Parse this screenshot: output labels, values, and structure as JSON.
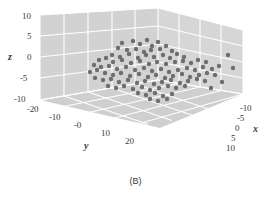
{
  "caption": "(B)",
  "colors": {
    "panel": "#d2d2d2",
    "panel_floor": "#cfcfcf",
    "panel_left": "#d6d6d6",
    "grid": "#ffffff",
    "point": "#6e6e6e",
    "text": "#3a3a3a",
    "background": "#ffffff"
  },
  "axes": {
    "x": {
      "label": "x",
      "ticks": [
        "-10",
        "-5",
        "0",
        "5",
        "10"
      ],
      "tick_values": [
        -10,
        -5,
        0,
        5,
        10
      ],
      "range": [
        -12,
        12
      ]
    },
    "y": {
      "label": "y",
      "ticks": [
        "-20",
        "-10",
        "-0",
        "10",
        "20"
      ],
      "tick_values": [
        -20,
        -10,
        0,
        10,
        20
      ],
      "range": [
        -26,
        26
      ]
    },
    "z": {
      "label": "z",
      "ticks": [
        "10",
        "5",
        "0",
        "-5",
        "-10"
      ],
      "tick_values": [
        10,
        5,
        0,
        -5,
        -10
      ],
      "range": [
        -12,
        12
      ]
    }
  },
  "chart_data": {
    "type": "scatter",
    "title": "",
    "subtitle": "",
    "caption": "(B)",
    "projection": "3d",
    "xlabel": "x",
    "ylabel": "y",
    "zlabel": "z",
    "xlim": [
      -12,
      12
    ],
    "ylim": [
      -26,
      26
    ],
    "zlim": [
      -12,
      12
    ],
    "xticks": [
      -10,
      -5,
      0,
      5,
      10
    ],
    "yticks": [
      -20,
      -10,
      0,
      10,
      20
    ],
    "zticks": [
      -10,
      -5,
      0,
      5,
      10
    ],
    "grid": true,
    "legend": null,
    "legend_position": "none",
    "marker": "circle",
    "marker_color": "#6e6e6e",
    "marker_size": 2.2,
    "n_points": 104,
    "screen_points": [
      [
        122,
        43
      ],
      [
        133,
        41
      ],
      [
        140,
        44
      ],
      [
        147,
        40
      ],
      [
        152,
        46
      ],
      [
        158,
        42
      ],
      [
        118,
        48
      ],
      [
        127,
        50
      ],
      [
        136,
        49
      ],
      [
        144,
        52
      ],
      [
        151,
        50
      ],
      [
        160,
        49
      ],
      [
        166,
        46
      ],
      [
        172,
        51
      ],
      [
        112,
        55
      ],
      [
        120,
        57
      ],
      [
        129,
        54
      ],
      [
        138,
        58
      ],
      [
        146,
        55
      ],
      [
        154,
        57
      ],
      [
        163,
        55
      ],
      [
        170,
        58
      ],
      [
        177,
        54
      ],
      [
        184,
        57
      ],
      [
        99,
        60
      ],
      [
        106,
        58
      ],
      [
        113,
        62
      ],
      [
        122,
        60
      ],
      [
        131,
        63
      ],
      [
        140,
        61
      ],
      [
        149,
        64
      ],
      [
        157,
        62
      ],
      [
        166,
        64
      ],
      [
        175,
        62
      ],
      [
        183,
        61
      ],
      [
        191,
        63
      ],
      [
        198,
        60
      ],
      [
        206,
        62
      ],
      [
        94,
        65
      ],
      [
        101,
        67
      ],
      [
        109,
        66
      ],
      [
        117,
        69
      ],
      [
        126,
        67
      ],
      [
        135,
        70
      ],
      [
        144,
        68
      ],
      [
        152,
        71
      ],
      [
        161,
        69
      ],
      [
        169,
        72
      ],
      [
        178,
        70
      ],
      [
        187,
        68
      ],
      [
        195,
        70
      ],
      [
        203,
        67
      ],
      [
        212,
        69
      ],
      [
        219,
        66
      ],
      [
        90,
        72
      ],
      [
        97,
        70
      ],
      [
        105,
        73
      ],
      [
        113,
        75
      ],
      [
        121,
        73
      ],
      [
        130,
        76
      ],
      [
        139,
        74
      ],
      [
        148,
        77
      ],
      [
        156,
        75
      ],
      [
        165,
        78
      ],
      [
        173,
        76
      ],
      [
        182,
        74
      ],
      [
        190,
        77
      ],
      [
        199,
        75
      ],
      [
        207,
        73
      ],
      [
        215,
        75
      ],
      [
        95,
        78
      ],
      [
        103,
        80
      ],
      [
        111,
        79
      ],
      [
        119,
        82
      ],
      [
        128,
        80
      ],
      [
        137,
        83
      ],
      [
        145,
        81
      ],
      [
        154,
        84
      ],
      [
        162,
        82
      ],
      [
        171,
        80
      ],
      [
        180,
        83
      ],
      [
        188,
        81
      ],
      [
        197,
        79
      ],
      [
        205,
        81
      ],
      [
        108,
        86
      ],
      [
        116,
        88
      ],
      [
        124,
        86
      ],
      [
        133,
        89
      ],
      [
        142,
        87
      ],
      [
        150,
        90
      ],
      [
        159,
        88
      ],
      [
        168,
        86
      ],
      [
        176,
        88
      ],
      [
        185,
        86
      ],
      [
        138,
        93
      ],
      [
        146,
        95
      ],
      [
        155,
        93
      ],
      [
        163,
        96
      ],
      [
        172,
        94
      ],
      [
        150,
        99
      ],
      [
        158,
        101
      ],
      [
        167,
        99
      ],
      [
        228,
        55
      ],
      [
        233,
        68
      ],
      [
        222,
        82
      ],
      [
        211,
        88
      ]
    ]
  }
}
